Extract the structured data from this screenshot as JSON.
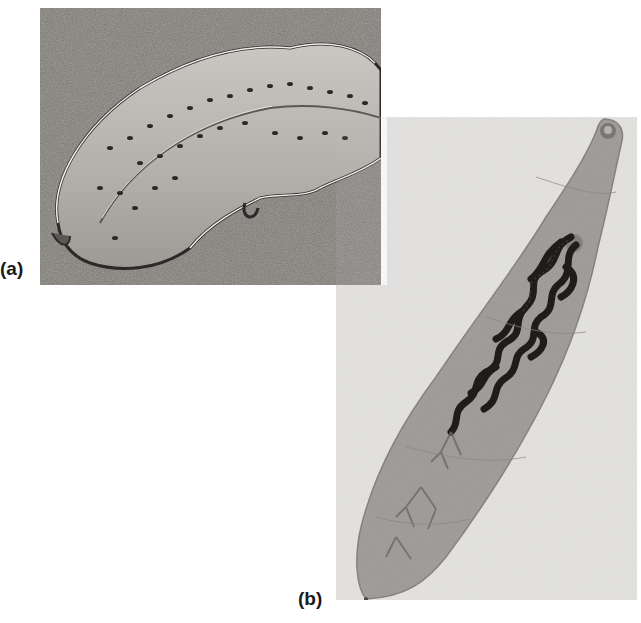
{
  "figure": {
    "panels": [
      {
        "label": "(a)",
        "description": "Marine flatworm with dark spots and ruffled white-edged margin resting on sandy substrate",
        "tone": "grayscale photograph"
      },
      {
        "label": "(b)",
        "description": "Stained fluke specimen, elongated leaf-shaped body with dark branched reproductive organs on light background",
        "tone": "grayscale micrograph"
      }
    ]
  }
}
